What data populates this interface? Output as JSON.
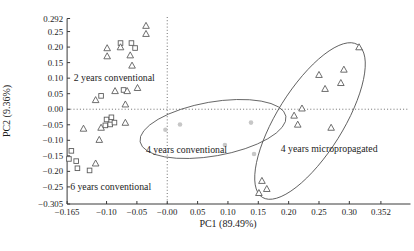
{
  "chart_data": {
    "type": "scatter",
    "title": "",
    "xlabel": "PC1 (89.49%)",
    "ylabel": "PC2 (9.36%)",
    "x_axis": {
      "min": -0.165,
      "max": 0.352,
      "grid": false,
      "tick_values": [
        -0.165,
        -0.1,
        -0.05,
        0,
        0.05,
        0.1,
        0.15,
        0.2,
        0.25,
        0.3,
        0.352
      ],
      "tick_labels": [
        "−0.165",
        "−0.10",
        "−0.05",
        "−0.00",
        "0.05",
        "0.10",
        "0.15",
        "0.20",
        "0.25",
        "0.30",
        "0.352"
      ]
    },
    "y_axis": {
      "min": -0.305,
      "max": 0.292,
      "grid": false,
      "tick_values": [
        0.292,
        0.25,
        0.2,
        0.15,
        0.1,
        0.05,
        0,
        -0.05,
        -0.1,
        -0.15,
        -0.2,
        -0.25,
        -0.305
      ],
      "tick_labels": [
        "0.292",
        "0.25",
        "0.20",
        "0.15",
        "0.10",
        "0.05",
        "0.00",
        "−0.05",
        "−0.10",
        "−0.15",
        "−0.20",
        "−0.25",
        "−0.305"
      ]
    },
    "reference_lines": {
      "vertical_x": 0,
      "horizontal_y": 0,
      "style": "dotted"
    },
    "series": [
      {
        "name": "conventional-squares",
        "marker": "square",
        "points": [
          [
            -0.077,
            0.213
          ],
          [
            -0.059,
            0.213
          ],
          [
            -0.053,
            0.197
          ],
          [
            -0.072,
            0.062
          ],
          [
            -0.109,
            0.043
          ],
          [
            -0.1,
            -0.033
          ],
          [
            -0.092,
            -0.026
          ],
          [
            -0.102,
            -0.052
          ],
          [
            -0.094,
            -0.049
          ],
          [
            -0.087,
            -0.043
          ],
          [
            -0.158,
            -0.134
          ],
          [
            -0.162,
            -0.16
          ],
          [
            -0.15,
            -0.167
          ],
          [
            -0.148,
            -0.19
          ],
          [
            -0.128,
            -0.197
          ]
        ]
      },
      {
        "name": "conventional-triangles",
        "marker": "triangle",
        "points": [
          [
            -0.035,
            0.269
          ],
          [
            -0.035,
            0.243
          ],
          [
            -0.099,
            0.197
          ],
          [
            -0.099,
            0.171
          ],
          [
            -0.077,
            0.2
          ],
          [
            -0.061,
            0.174
          ],
          [
            -0.058,
            0.141
          ],
          [
            -0.086,
            0.059
          ],
          [
            -0.066,
            0.059
          ],
          [
            -0.049,
            0.069
          ],
          [
            -0.118,
            0.03
          ],
          [
            -0.069,
            0.016
          ],
          [
            -0.138,
            -0.062
          ],
          [
            -0.109,
            -0.059
          ],
          [
            -0.112,
            -0.098
          ],
          [
            -0.118,
            -0.174
          ],
          [
            -0.069,
            -0.043
          ]
        ]
      },
      {
        "name": "micropropagated-triangles",
        "marker": "triangle",
        "points": [
          [
            0.316,
            0.2
          ],
          [
            0.291,
            0.128
          ],
          [
            0.286,
            0.085
          ],
          [
            0.25,
            0.111
          ],
          [
            0.26,
            0.066
          ],
          [
            0.222,
            0.003
          ],
          [
            0.209,
            -0.02
          ],
          [
            0.215,
            -0.049
          ],
          [
            0.27,
            -0.059
          ],
          [
            0.156,
            -0.23
          ],
          [
            0.164,
            -0.256
          ],
          [
            0.151,
            -0.269
          ]
        ]
      },
      {
        "name": "four-years-conventional-dots",
        "marker": "circle",
        "points": [
          [
            -0.003,
            -0.066
          ],
          [
            0.021,
            -0.049
          ],
          [
            0.138,
            -0.043
          ],
          [
            0.095,
            -0.115
          ],
          [
            0.143,
            -0.144
          ]
        ]
      }
    ],
    "annotations": [
      {
        "text": "2 years conventional",
        "x": -0.154,
        "y": 0.09
      },
      {
        "text": "4 years conventional",
        "x": -0.035,
        "y": -0.142
      },
      {
        "text": "6 years conventional",
        "x": -0.16,
        "y": -0.261
      },
      {
        "text": "4 years micropropagated",
        "x": 0.187,
        "y": -0.139
      }
    ],
    "ellipses": [
      {
        "name": "four-years-conventional-cluster",
        "cx_px": 213,
        "cy_px": 129,
        "rx_px": 74,
        "ry_px": 27,
        "rotation_deg": -10
      },
      {
        "name": "four-years-micropropagated-cluster",
        "cx_px": 310,
        "cy_px": 121,
        "rx_px": 90,
        "ry_px": 33,
        "rotation_deg": -58
      }
    ]
  },
  "colors": {
    "background": "#ffffff",
    "axis": "#3a3a3a",
    "marker_outline": "#5d5d5d",
    "gray_dot": "#c7c7c7",
    "text": "#1c1c1c"
  }
}
